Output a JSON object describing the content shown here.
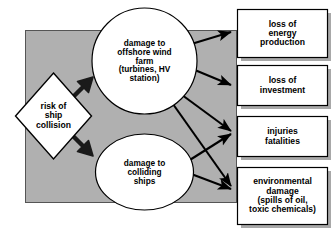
{
  "diagram": {
    "background_color": "#b0b0b0",
    "node_fill": "#ffffff",
    "stroke_color": "#000000",
    "shadow_color": "#a8a8a8",
    "source": {
      "id": "risk-of-ship-collision",
      "shape": "diamond",
      "label": "risk of\nship\ncollision"
    },
    "intermediates": [
      {
        "id": "damage-offshore-wind-farm",
        "shape": "ellipse",
        "label": "damage to\noffshore wind\nfarm\n(turbines, HV\nstation)"
      },
      {
        "id": "damage-colliding-ships",
        "shape": "ellipse",
        "label": "damage to\ncolliding\nships"
      }
    ],
    "outcomes": [
      {
        "id": "loss-of-energy-production",
        "shape": "rectangle",
        "label": "loss of\nenergy\nproduction"
      },
      {
        "id": "loss-of-investment",
        "shape": "rectangle",
        "label": "loss of\ninvestment"
      },
      {
        "id": "injuries-fatalities",
        "shape": "rectangle",
        "label": "injuries\nfatalities"
      },
      {
        "id": "environmental-damage",
        "shape": "rectangle",
        "label": "environmental\ndamage\n(spills of oil,\ntoxic chemicals)"
      }
    ],
    "connectors": [
      {
        "from": "risk-of-ship-collision",
        "to": "damage-offshore-wind-farm",
        "style": "block-arrow"
      },
      {
        "from": "risk-of-ship-collision",
        "to": "damage-colliding-ships",
        "style": "block-arrow"
      },
      {
        "from": "damage-offshore-wind-farm",
        "to": "loss-of-energy-production",
        "style": "line-arrow"
      },
      {
        "from": "damage-offshore-wind-farm",
        "to": "loss-of-investment",
        "style": "line-arrow"
      },
      {
        "from": "damage-offshore-wind-farm",
        "to": "injuries-fatalities",
        "style": "line-arrow"
      },
      {
        "from": "damage-offshore-wind-farm",
        "to": "environmental-damage",
        "style": "line-arrow"
      },
      {
        "from": "damage-colliding-ships",
        "to": "injuries-fatalities",
        "style": "line-arrow"
      },
      {
        "from": "damage-colliding-ships",
        "to": "environmental-damage",
        "style": "line-arrow"
      }
    ]
  }
}
